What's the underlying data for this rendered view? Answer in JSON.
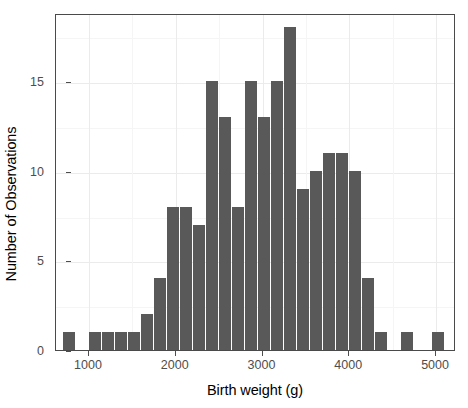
{
  "chart_data": {
    "type": "bar",
    "title": "",
    "subtitle": "",
    "xlabel": "Birth weight (g)",
    "ylabel": "Number of Observations",
    "xlim": [
      620,
      5230
    ],
    "ylim": [
      0,
      18.8
    ],
    "bin_width": 150,
    "grid": true,
    "legend": null,
    "bar_color": "#595959",
    "panel_border_color": "#4a4a4a",
    "grid_color": "#ebebeb",
    "x_ticks": [
      1000,
      2000,
      3000,
      4000,
      5000
    ],
    "x_tick_labels": [
      "1000",
      "2000",
      "3000",
      "4000",
      "5000"
    ],
    "y_ticks": [
      0,
      5,
      10,
      15
    ],
    "y_tick_labels": [
      "0",
      "5",
      "10",
      "15"
    ],
    "bins": [
      {
        "x0": 700,
        "x1": 850,
        "center": 775,
        "value": 1
      },
      {
        "x0": 1000,
        "x1": 1150,
        "center": 1075,
        "value": 1
      },
      {
        "x0": 1150,
        "x1": 1300,
        "center": 1225,
        "value": 1
      },
      {
        "x0": 1300,
        "x1": 1450,
        "center": 1375,
        "value": 1
      },
      {
        "x0": 1450,
        "x1": 1600,
        "center": 1525,
        "value": 1
      },
      {
        "x0": 1600,
        "x1": 1750,
        "center": 1675,
        "value": 2
      },
      {
        "x0": 1750,
        "x1": 1900,
        "center": 1825,
        "value": 4
      },
      {
        "x0": 1900,
        "x1": 2050,
        "center": 1975,
        "value": 8
      },
      {
        "x0": 2050,
        "x1": 2200,
        "center": 2125,
        "value": 8
      },
      {
        "x0": 2200,
        "x1": 2350,
        "center": 2275,
        "value": 7
      },
      {
        "x0": 2350,
        "x1": 2500,
        "center": 2425,
        "value": 15
      },
      {
        "x0": 2500,
        "x1": 2650,
        "center": 2575,
        "value": 13
      },
      {
        "x0": 2650,
        "x1": 2800,
        "center": 2725,
        "value": 8
      },
      {
        "x0": 2800,
        "x1": 2950,
        "center": 2875,
        "value": 15
      },
      {
        "x0": 2950,
        "x1": 3100,
        "center": 3025,
        "value": 13
      },
      {
        "x0": 3100,
        "x1": 3250,
        "center": 3175,
        "value": 15
      },
      {
        "x0": 3250,
        "x1": 3400,
        "center": 3325,
        "value": 18
      },
      {
        "x0": 3400,
        "x1": 3550,
        "center": 3475,
        "value": 9
      },
      {
        "x0": 3550,
        "x1": 3700,
        "center": 3625,
        "value": 10
      },
      {
        "x0": 3700,
        "x1": 3850,
        "center": 3775,
        "value": 11
      },
      {
        "x0": 3850,
        "x1": 4000,
        "center": 3925,
        "value": 11
      },
      {
        "x0": 4000,
        "x1": 4150,
        "center": 4075,
        "value": 10
      },
      {
        "x0": 4150,
        "x1": 4300,
        "center": 4225,
        "value": 4
      },
      {
        "x0": 4300,
        "x1": 4450,
        "center": 4375,
        "value": 1
      },
      {
        "x0": 4600,
        "x1": 4750,
        "center": 4675,
        "value": 1
      },
      {
        "x0": 4950,
        "x1": 5100,
        "center": 5025,
        "value": 1
      }
    ]
  }
}
